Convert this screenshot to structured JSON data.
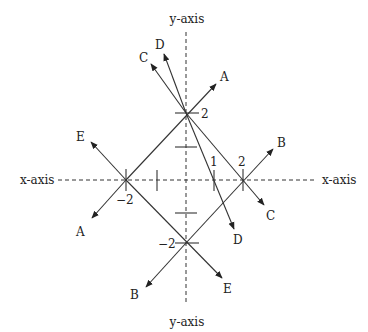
{
  "diagram": {
    "axes": {
      "x_label_left": "x-axis",
      "x_label_right": "x-axis",
      "y_label_top": "y-axis",
      "y_label_bottom": "y-axis"
    },
    "ticks": {
      "y_pos2": "2",
      "y_neg2": "−2",
      "x_neg2": "−2",
      "x_pos2": "2",
      "x_pos1": "1"
    },
    "lines": [
      {
        "name": "A",
        "label_top": "A",
        "label_bottom": "A",
        "description": "line through (-2,0) and (0,2), slope +1"
      },
      {
        "name": "B",
        "label_top": "B",
        "label_bottom": "B",
        "description": "line through (0,-2) and (2,0), slope +1"
      },
      {
        "name": "C",
        "label_top": "C",
        "label_bottom": "C",
        "description": "line through (0,2) and (2,0), slope -1"
      },
      {
        "name": "D",
        "label_top": "D",
        "label_bottom": "D",
        "description": "line through (0,2) and (1,0), slope -2"
      },
      {
        "name": "E",
        "label_top": "E",
        "label_bottom": "E",
        "description": "line through (-2,0) and (0,-2), slope -1"
      }
    ]
  }
}
